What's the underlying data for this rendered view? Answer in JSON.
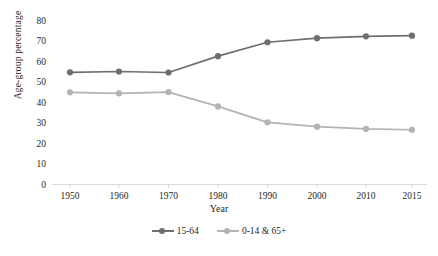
{
  "chart_data": {
    "type": "line",
    "title": "",
    "xlabel": "Year",
    "ylabel": "Age-group percentage",
    "categories": [
      "1950",
      "1960",
      "1970",
      "1980",
      "1990",
      "2000",
      "2010",
      "2015"
    ],
    "x": [
      1950,
      1960,
      1970,
      1980,
      1990,
      2000,
      2010,
      2015
    ],
    "ylim": [
      0,
      80
    ],
    "yticks": [
      "0",
      "10",
      "20",
      "30",
      "40",
      "50",
      "60",
      "70",
      "80"
    ],
    "grid": false,
    "legend_position": "bottom",
    "series": [
      {
        "name": "15-64",
        "color": "#6e6e6e",
        "values": [
          54.9,
          55.3,
          54.8,
          62.8,
          69.6,
          71.6,
          72.5,
          72.8
        ]
      },
      {
        "name": "0-14 & 65+",
        "color": "#b3b3b3",
        "values": [
          45.1,
          44.6,
          45.2,
          38.2,
          30.4,
          28.3,
          27.2,
          26.8
        ]
      }
    ]
  },
  "legend": {
    "entries": [
      {
        "label": "15-64"
      },
      {
        "label": "0-14 & 65+"
      }
    ]
  },
  "colors": {
    "series_dark": "#6e6e6e",
    "series_light": "#b3b3b3",
    "axis": "#d9d9d9",
    "text": "#1f1f1f"
  }
}
